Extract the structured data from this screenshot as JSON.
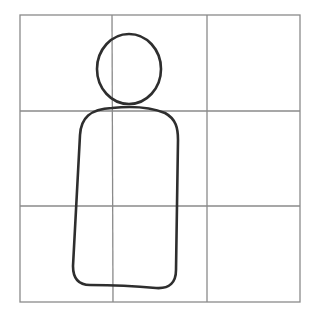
{
  "figure": {
    "grid": {
      "rows": 3,
      "columns": 3
    },
    "colors": {
      "grid_line": "#8a8a8a",
      "figure_stroke": "#2e2e2e",
      "background": "#ffffff"
    },
    "elements": [
      "head",
      "body"
    ]
  }
}
